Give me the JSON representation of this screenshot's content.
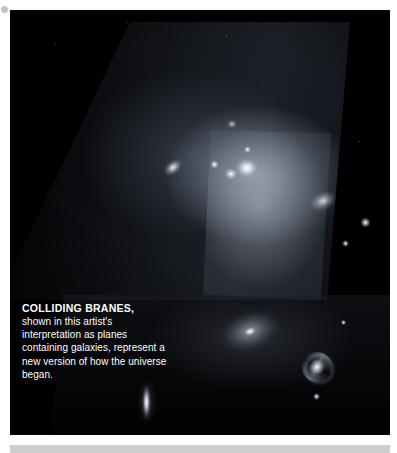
{
  "page": {
    "background_color": "#ffffff",
    "plate_color": "#000000",
    "footer_band_color": "#cfcfcf"
  },
  "figure": {
    "alt_name": "colliding-branes-artist-illustration",
    "elements": [
      {
        "name": "upper-brane-sheet",
        "description": "tilted parallelogram plane densely filled with stars"
      },
      {
        "name": "lower-brane-sheet",
        "description": "second darker plane below, containing spiral galaxies"
      },
      {
        "name": "spiral-galaxy-tilted",
        "description": "tilted spiral galaxy on the upper plane"
      },
      {
        "name": "bright-core-cluster",
        "description": "bright glowing cluster at the centre of the upper plane"
      },
      {
        "name": "diffuse-spiral-galaxy",
        "description": "large faint tilted spiral on the lower plane"
      },
      {
        "name": "face-on-spiral-galaxy",
        "description": "face-on barred spiral galaxy, lower right"
      },
      {
        "name": "edge-on-spindle-galaxy",
        "description": "edge-on spindle galaxy, lower left"
      }
    ]
  },
  "caption": {
    "title": "COLLIDING BRANES,",
    "body": "shown in this artist's interpretation as planes containing galaxies, represent a new version of how the universe began."
  }
}
